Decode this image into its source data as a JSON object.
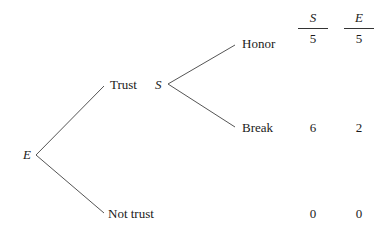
{
  "tree": {
    "root": {
      "player": "E"
    },
    "first_moves": [
      {
        "label": "Trust"
      },
      {
        "label": "Not trust"
      }
    ],
    "second_node": {
      "player": "S"
    },
    "second_moves": [
      {
        "label": "Honor"
      },
      {
        "label": "Break"
      }
    ]
  },
  "payoffs": {
    "headers": [
      "S",
      "E"
    ],
    "rows": [
      {
        "outcome": "Honor",
        "S": "5",
        "E": "5"
      },
      {
        "outcome": "Break",
        "S": "6",
        "E": "2"
      },
      {
        "outcome": "Not trust",
        "S": "0",
        "E": "0"
      }
    ]
  },
  "colors": {
    "line": "#555555",
    "text": "#1a1a1a",
    "background": "#ffffff"
  }
}
